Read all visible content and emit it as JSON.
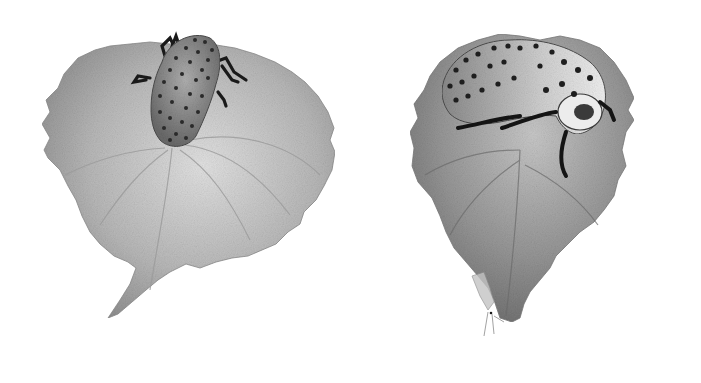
{
  "image": {
    "description": "Pencil illustration of two spotted beetle larvae resting on heart-shaped serrated leaves",
    "background": "#ffffff",
    "colors": {
      "leaf_light": "#d4d4d4",
      "leaf_mid": "#a8a8a8",
      "leaf_dark": "#7a7a7a",
      "larva_body": "#9a9a9a",
      "larva_spot": "#2a2a2a",
      "larva_pale": "#e8e8e8",
      "legs": "#1a1a1a"
    }
  },
  "subjects": [
    {
      "name": "left-leaf-with-larva",
      "larva_pose": "crawling head-down, dorsal view, densely spotted"
    },
    {
      "name": "right-leaf-with-larva",
      "larva_pose": "curled side view, black legs, pale spotted head"
    }
  ]
}
